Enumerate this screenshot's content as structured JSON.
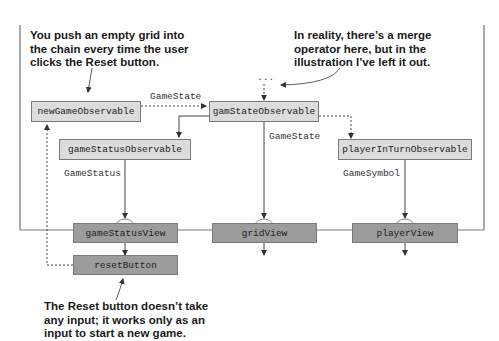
{
  "observables": {
    "new_game": "newGameObservable",
    "game_state": "gamStateObservable",
    "game_status": "gameStatusObservable",
    "player_in_turn": "playerInTurnObservable"
  },
  "views": {
    "game_status_view": "gameStatusView",
    "grid_view": "gridView",
    "player_view": "playerView",
    "reset_button": "resetButton"
  },
  "edge_labels": {
    "new_to_state": "GameState",
    "state_to_grid": "GameState",
    "status_to_view": "GameStatus",
    "player_to_view": "GameSymbol"
  },
  "merge_marker": "...",
  "annotations": {
    "top_left": [
      "You push an empty grid into",
      "the chain every time the user",
      "clicks the Reset button."
    ],
    "top_right": [
      "In reality, there’s a merge",
      "operator here, but in the",
      "illustration I’ve left it out."
    ],
    "bottom": [
      "The Reset button doesn’t take",
      "any input; it works only as an",
      "input to start a new game."
    ]
  }
}
